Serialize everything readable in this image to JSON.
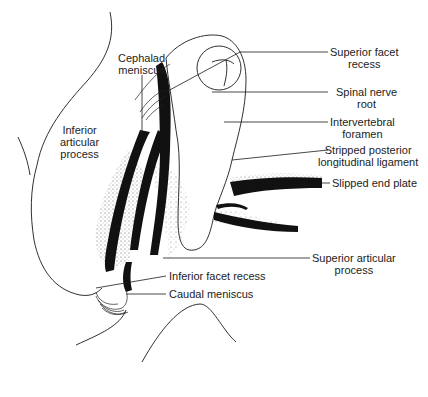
{
  "diagram": {
    "type": "anatomical-illustration",
    "labels": {
      "cephalad_meniscus": "Cephalad\nmeniscus",
      "inferior_articular_process": "Inferior\narticular\nprocess",
      "superior_facet_recess": "Superior facet\nrecess",
      "spinal_nerve_root": "Spinal nerve\nroot",
      "intervertebral_foramen": "Intervertebral\nforamen",
      "stripped_pll": "Stripped posterior\nlongitudinal ligament",
      "slipped_end_plate": "Slipped end plate",
      "superior_articular_process": "Superior articular\nprocess",
      "inferior_facet_recess": "Inferior facet recess",
      "caudal_meniscus": "Caudal meniscus"
    },
    "colors": {
      "line": "#1a1a1a",
      "fill_dark": "#111111",
      "stipple": "#555555",
      "background": "#ffffff"
    }
  }
}
